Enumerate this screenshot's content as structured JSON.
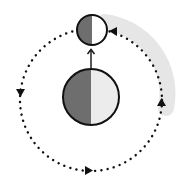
{
  "diagram": {
    "title": "",
    "description": "A moon orbiting a planet counterclockwise; both bodies are half lit and half dark, with an arrow pointing from the planet to the moon",
    "colors": {
      "background": "#ffffff",
      "outline": "#111111",
      "dark_half": "#6e6e6e",
      "light_half": "#ececec",
      "moon_light_half": "#ffffff",
      "orbit_dots": "#111111",
      "shadow_band": "#e4e4e4"
    },
    "planet": {
      "cx": 91,
      "cy": 97,
      "r": 28,
      "dark_side": "left",
      "lit_side": "right"
    },
    "moon": {
      "cx": 92,
      "cy": 30,
      "r": 15,
      "dark_side": "left",
      "lit_side": "right"
    },
    "connector_arrow": {
      "from": [
        91,
        68
      ],
      "to": [
        91,
        48
      ],
      "direction": "up"
    },
    "orbit": {
      "cx": 91,
      "cy": 100,
      "r": 71,
      "style": "dotted",
      "direction": "counterclockwise",
      "arrowheads": [
        {
          "position": "left",
          "points": "down"
        },
        {
          "position": "bottom",
          "points": "right"
        },
        {
          "position": "right",
          "points": "up"
        },
        {
          "position": "top-right",
          "points": "left"
        }
      ]
    },
    "shaded_band": {
      "side": "right",
      "from": "moon",
      "to": "right-of-orbit"
    }
  }
}
